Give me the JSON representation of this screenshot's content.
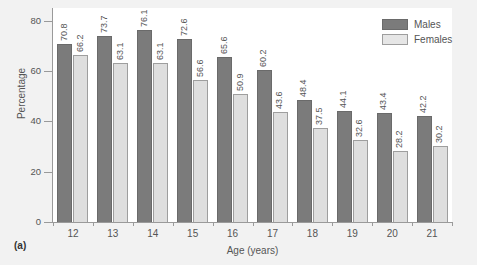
{
  "figure": {
    "panel_caption": "(a)",
    "background_color": "#f2f2f2",
    "plot_background_color": "#ffffff"
  },
  "legend": {
    "position": "top-right",
    "items": [
      {
        "label": "Males",
        "color": "#7b7b7b"
      },
      {
        "label": "Females",
        "color": "#e6e6e6"
      }
    ]
  },
  "chart_data": {
    "type": "bar",
    "title": "",
    "subtitle": "",
    "xlabel": "Age (years)",
    "ylabel": "Percentage",
    "categories": [
      "12",
      "13",
      "14",
      "15",
      "16",
      "17",
      "18",
      "19",
      "20",
      "21"
    ],
    "series": [
      {
        "name": "Males",
        "color": "#7b7b7b",
        "values": [
          70.8,
          73.7,
          76.1,
          72.6,
          65.6,
          60.2,
          48.4,
          44.1,
          43.4,
          42.2
        ]
      },
      {
        "name": "Females",
        "color": "#e6e6e6",
        "values": [
          66.2,
          63.1,
          63.1,
          56.6,
          50.9,
          43.6,
          37.5,
          32.6,
          28.2,
          30.2
        ]
      }
    ],
    "ylim": [
      0,
      85
    ],
    "yticks": [
      0,
      20,
      40,
      60,
      80
    ],
    "ytick_labels": [
      "0",
      "20",
      "40",
      "60",
      "80"
    ],
    "grid": false,
    "data_labels": true,
    "data_label_rotation": -90
  }
}
